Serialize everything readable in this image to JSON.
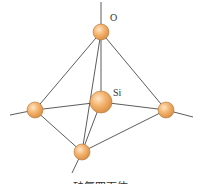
{
  "figure": {
    "caption": "硅氧四面体",
    "labels": {
      "oxygen": "O",
      "silicon": "Si"
    },
    "colors": {
      "atom_fill": "#f2b06a",
      "atom_highlight": "#fde3c4",
      "atom_stroke": "#b07a40",
      "bond": "#4a4a4a"
    },
    "atoms": [
      {
        "id": "O-top",
        "element": "O",
        "cx": 101,
        "cy": 32,
        "r": 8
      },
      {
        "id": "O-left",
        "element": "O",
        "cx": 35,
        "cy": 110,
        "r": 8
      },
      {
        "id": "O-right",
        "element": "O",
        "cx": 166,
        "cy": 110,
        "r": 8
      },
      {
        "id": "O-bottom",
        "element": "O",
        "cx": 82,
        "cy": 152,
        "r": 8
      },
      {
        "id": "Si-center",
        "element": "Si",
        "cx": 101,
        "cy": 102,
        "r": 11
      }
    ]
  }
}
